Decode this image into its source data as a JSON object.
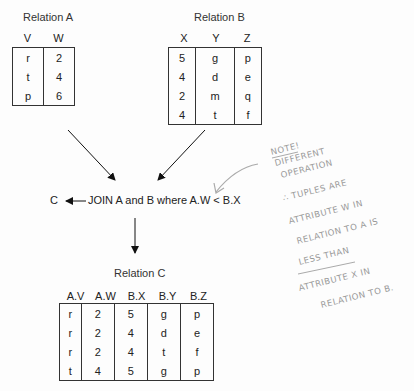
{
  "relation_a": {
    "title": "Relation A",
    "columns": [
      "V",
      "W"
    ],
    "rows": [
      [
        "r",
        "2"
      ],
      [
        "t",
        "4"
      ],
      [
        "p",
        "6"
      ]
    ]
  },
  "relation_b": {
    "title": "Relation B",
    "columns": [
      "X",
      "Y",
      "Z"
    ],
    "rows": [
      [
        "5",
        "g",
        "p"
      ],
      [
        "4",
        "d",
        "e"
      ],
      [
        "2",
        "m",
        "q"
      ],
      [
        "4",
        "t",
        "f"
      ]
    ]
  },
  "operation": {
    "result_name": "C",
    "expression": "JOIN A and B where A.W < B.X"
  },
  "relation_c": {
    "title": "Relation C",
    "columns": [
      "A.V",
      "A.W",
      "B.X",
      "B.Y",
      "B.Z"
    ],
    "rows": [
      [
        "r",
        "2",
        "5",
        "g",
        "p"
      ],
      [
        "r",
        "2",
        "4",
        "d",
        "e"
      ],
      [
        "r",
        "2",
        "4",
        "t",
        "f"
      ],
      [
        "t",
        "4",
        "5",
        "g",
        "p"
      ]
    ]
  },
  "handwritten_note": {
    "lines": [
      "NOTE!",
      "DIFFERENT",
      "OPERATION",
      "∴ TUPLES ARE",
      "ATTRIBUTE W IN",
      "RELATION TO A IS",
      "LESS THAN",
      "ATTRIBUTE X IN",
      "RELATION TO B."
    ],
    "color": "#999999"
  }
}
